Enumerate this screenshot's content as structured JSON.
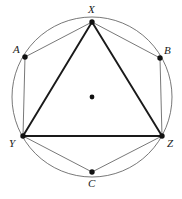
{
  "figure": {
    "kind": "geometry-diagram",
    "width": 182,
    "height": 199,
    "background_color": "#ffffff",
    "stroke_color_thin": "#555555",
    "stroke_color_thick": "#1a1a1a",
    "point_color": "#111111",
    "circle": {
      "name": "circumcircle",
      "cx": 92,
      "cy": 97,
      "r": 80,
      "stroke_width": 0.8
    },
    "center_point": {
      "name": "circle-center",
      "cx": 92,
      "cy": 97,
      "r": 2.4,
      "label": ""
    },
    "points": [
      {
        "id": "X",
        "label": "X",
        "cx": 92,
        "cy": 22,
        "r": 2.7,
        "label_x": 88,
        "label_y": 4,
        "on_circle": true
      },
      {
        "id": "A",
        "label": "A",
        "cx": 25,
        "cy": 57,
        "r": 2.7,
        "label_x": 13,
        "label_y": 44,
        "on_circle": true
      },
      {
        "id": "B",
        "label": "B",
        "cx": 160,
        "cy": 58,
        "r": 2.7,
        "label_x": 164,
        "label_y": 45,
        "on_circle": true
      },
      {
        "id": "Y",
        "label": "Y",
        "cx": 23,
        "cy": 136,
        "r": 2.7,
        "label_x": 9,
        "label_y": 138,
        "on_circle": true
      },
      {
        "id": "Z",
        "label": "Z",
        "cx": 162,
        "cy": 136,
        "r": 2.7,
        "label_x": 167,
        "label_y": 138,
        "on_circle": true
      },
      {
        "id": "C",
        "label": "C",
        "cx": 92,
        "cy": 172,
        "r": 2.7,
        "label_x": 88,
        "label_y": 178,
        "on_circle": true
      }
    ],
    "triangle": {
      "name": "triangle-XYZ",
      "vertices": [
        "X",
        "Y",
        "Z"
      ],
      "stroke_width": 1.9,
      "edges": [
        {
          "id": "XY",
          "x1": 92,
          "y1": 22,
          "x2": 23,
          "y2": 136
        },
        {
          "id": "XZ",
          "x1": 92,
          "y1": 22,
          "x2": 162,
          "y2": 136
        },
        {
          "id": "YZ",
          "x1": 23,
          "y1": 136,
          "x2": 162,
          "y2": 136
        }
      ]
    },
    "chords": [
      {
        "id": "XA",
        "x1": 92,
        "y1": 22,
        "x2": 25,
        "y2": 57,
        "stroke_width": 0.8
      },
      {
        "id": "AY",
        "x1": 25,
        "y1": 57,
        "x2": 23,
        "y2": 136,
        "stroke_width": 0.8
      },
      {
        "id": "XB",
        "x1": 92,
        "y1": 22,
        "x2": 160,
        "y2": 58,
        "stroke_width": 0.8
      },
      {
        "id": "BZ",
        "x1": 160,
        "y1": 58,
        "x2": 162,
        "y2": 136,
        "stroke_width": 0.8
      },
      {
        "id": "YC",
        "x1": 23,
        "y1": 136,
        "x2": 92,
        "y2": 172,
        "stroke_width": 0.8
      },
      {
        "id": "CZ",
        "x1": 92,
        "y1": 172,
        "x2": 162,
        "y2": 136,
        "stroke_width": 0.8
      }
    ],
    "labels": {
      "X": "X",
      "A": "A",
      "B": "B",
      "Y": "Y",
      "Z": "Z",
      "C": "C"
    }
  }
}
